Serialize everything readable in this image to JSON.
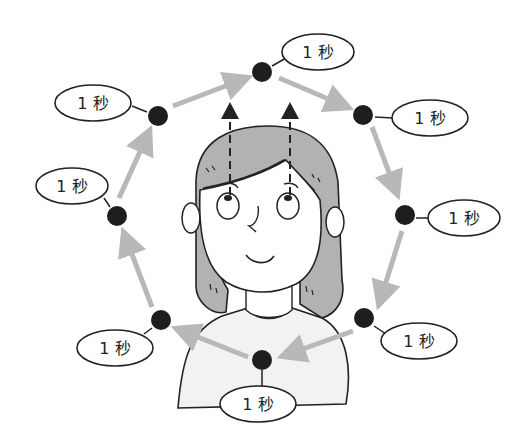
{
  "diagram": {
    "title": "",
    "colors": {
      "dot": "#1e1e1e",
      "arrow": "#b8b8b8",
      "hair": "#b2b2b2",
      "shirt": "#f2f2f2",
      "outline": "#222222"
    },
    "points": [
      {
        "id": "top",
        "label": "1 秒"
      },
      {
        "id": "upper-right",
        "label": "1 秒"
      },
      {
        "id": "right",
        "label": "1 秒"
      },
      {
        "id": "lower-right",
        "label": "1 秒"
      },
      {
        "id": "bottom",
        "label": "1 秒"
      },
      {
        "id": "lower-left",
        "label": "1 秒"
      },
      {
        "id": "left",
        "label": "1 秒"
      },
      {
        "id": "upper-left",
        "label": "1 秒"
      }
    ]
  }
}
